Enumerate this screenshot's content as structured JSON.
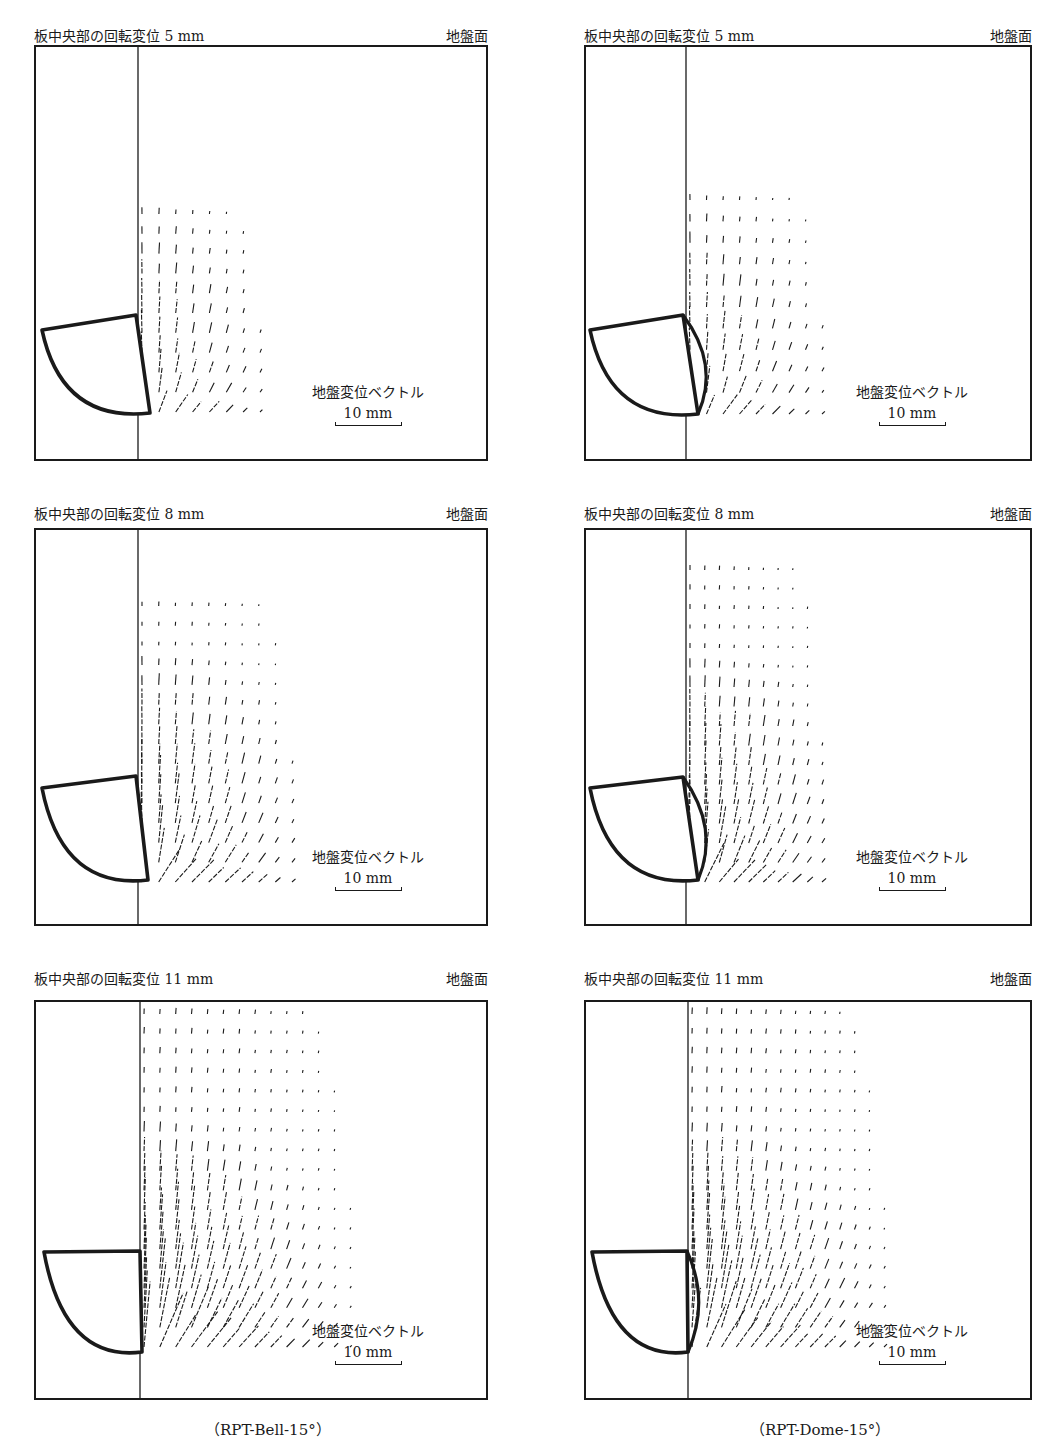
{
  "figure": {
    "columns": [
      {
        "caption": "（RPT-Bell-15°）",
        "plate_shape": "bell"
      },
      {
        "caption": "（RPT-Dome-15°）",
        "plate_shape": "dome"
      }
    ],
    "panels": [
      {
        "id": "bell-5",
        "column": 0,
        "title": "板中央部の回転変位 5 mm",
        "surface_label": "地盤面",
        "rotation_mm": 5,
        "legend_label": "地盤変位ベクトル",
        "scale_label": "10 mm"
      },
      {
        "id": "dome-5",
        "column": 1,
        "title": "板中央部の回転変位 5 mm",
        "surface_label": "地盤面",
        "rotation_mm": 5,
        "legend_label": "地盤変位ベクトル",
        "scale_label": "10 mm"
      },
      {
        "id": "bell-8",
        "column": 0,
        "title": "板中央部の回転変位 8 mm",
        "surface_label": "地盤面",
        "rotation_mm": 8,
        "legend_label": "地盤変位ベクトル",
        "scale_label": "10 mm"
      },
      {
        "id": "dome-8",
        "column": 1,
        "title": "板中央部の回転変位 8 mm",
        "surface_label": "地盤面",
        "rotation_mm": 8,
        "legend_label": "地盤変位ベクトル",
        "scale_label": "10 mm"
      },
      {
        "id": "bell-11",
        "column": 0,
        "title": "板中央部の回転変位 11 mm",
        "surface_label": "地盤面",
        "rotation_mm": 11,
        "legend_label": "地盤変位ベクトル",
        "scale_label": "10 mm"
      },
      {
        "id": "dome-11",
        "column": 1,
        "title": "板中央部の回転変位 11 mm",
        "surface_label": "地盤面",
        "rotation_mm": 11,
        "legend_label": "地盤変位ベクトル",
        "scale_label": "10 mm"
      }
    ],
    "vector_fields": [
      {
        "panel": "bell-5",
        "field_top": 212,
        "field_bottom": 410,
        "field_right": 258,
        "grid_cols": 8,
        "grid_rows": 11
      },
      {
        "panel": "dome-5",
        "field_top": 198,
        "field_bottom": 412,
        "field_right": 820,
        "grid_cols": 9,
        "grid_rows": 11
      },
      {
        "panel": "bell-8",
        "field_top": 604,
        "field_bottom": 880,
        "field_right": 290,
        "grid_cols": 10,
        "grid_rows": 15
      },
      {
        "panel": "dome-8",
        "field_top": 568,
        "field_bottom": 880,
        "field_right": 820,
        "grid_cols": 10,
        "grid_rows": 17
      },
      {
        "panel": "bell-11",
        "field_top": 1012,
        "field_bottom": 1345,
        "field_right": 348,
        "grid_cols": 14,
        "grid_rows": 18
      },
      {
        "panel": "dome-11",
        "field_top": 1012,
        "field_bottom": 1345,
        "field_right": 882,
        "grid_cols": 14,
        "grid_rows": 18
      }
    ],
    "colors": {
      "ink": "#1a1a1a",
      "background": "#ffffff"
    }
  }
}
